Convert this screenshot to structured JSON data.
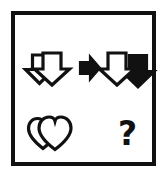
{
  "figure": {
    "type": "visual-analogy-puzzle",
    "background_color": "#ffffff",
    "frame": {
      "border_color": "#111111",
      "fill_color": "#ffffff",
      "border_width_px": 4
    },
    "ink_color": "#111111",
    "outline_fill_color": "#ffffff"
  },
  "rows": [
    {
      "name": "example-row",
      "source": {
        "label": "two overlapping outlined down arrows",
        "icon": "double-down-arrow-outline-icon",
        "shape": "down-arrow",
        "count": 2,
        "fills": [
          "outline",
          "outline"
        ]
      },
      "operator": {
        "label": "transforms to",
        "icon": "right-arrow-solid-icon",
        "shape": "right-arrow",
        "fill": "solid"
      },
      "result": {
        "label": "one outlined down arrow and one solid black down arrow",
        "icon": "down-arrow-outline-and-solid-icon",
        "shape": "down-arrow",
        "count": 2,
        "fills": [
          "outline",
          "solid"
        ]
      }
    },
    {
      "name": "question-row",
      "source": {
        "label": "two overlapping outlined hearts",
        "icon": "double-heart-outline-icon",
        "shape": "heart",
        "count": 2,
        "fills": [
          "outline",
          "outline"
        ]
      },
      "result": {
        "label": "unknown answer",
        "icon": "question-mark-icon",
        "text": "?"
      }
    }
  ]
}
